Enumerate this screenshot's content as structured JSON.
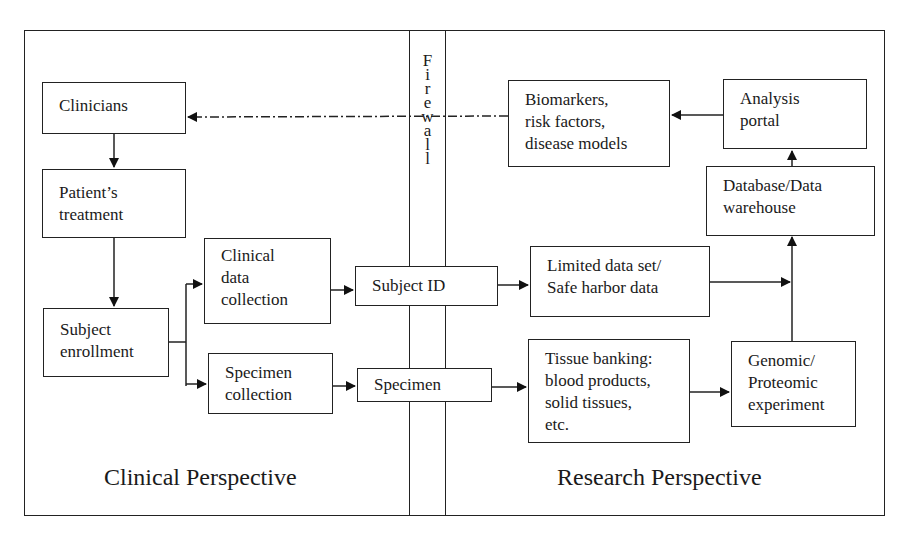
{
  "diagram": {
    "firewall": {
      "letters": [
        "F",
        "i",
        "r",
        "e",
        "w",
        "a",
        "l",
        "l"
      ]
    },
    "perspectives": {
      "clinical": "Clinical Perspective",
      "research": "Research Perspective"
    },
    "nodes": {
      "clinicians": [
        "Clinicians"
      ],
      "patients_treatment": [
        "Patient’s",
        "treatment"
      ],
      "subject_enrollment": [
        "Subject",
        "enrollment"
      ],
      "clinical_data_collection": [
        "Clinical",
        "data",
        "collection"
      ],
      "specimen_collection": [
        "Specimen",
        "collection"
      ],
      "subject_id": [
        "Subject ID"
      ],
      "specimen": [
        "Specimen"
      ],
      "biomarkers": [
        "Biomarkers,",
        "risk factors,",
        "disease models"
      ],
      "analysis_portal": [
        "Analysis",
        "portal"
      ],
      "database": [
        "Database/Data",
        "warehouse"
      ],
      "limited_data_set": [
        "Limited data set/",
        "Safe harbor data"
      ],
      "tissue_banking": [
        "Tissue banking:",
        "blood products,",
        "solid tissues,",
        "etc."
      ],
      "genomic": [
        "Genomic/",
        "Proteomic",
        "experiment"
      ]
    },
    "edges": [
      {
        "from": "clinicians",
        "to": "patients_treatment"
      },
      {
        "from": "patients_treatment",
        "to": "subject_enrollment"
      },
      {
        "from": "subject_enrollment",
        "to": "clinical_data_collection"
      },
      {
        "from": "subject_enrollment",
        "to": "specimen_collection"
      },
      {
        "from": "clinical_data_collection",
        "to": "subject_id"
      },
      {
        "from": "specimen_collection",
        "to": "specimen"
      },
      {
        "from": "subject_id",
        "to": "limited_data_set"
      },
      {
        "from": "specimen",
        "to": "tissue_banking"
      },
      {
        "from": "tissue_banking",
        "to": "genomic"
      },
      {
        "from": "limited_data_set",
        "to": "database"
      },
      {
        "from": "genomic",
        "to": "database"
      },
      {
        "from": "database",
        "to": "analysis_portal"
      },
      {
        "from": "analysis_portal",
        "to": "biomarkers"
      },
      {
        "from": "biomarkers",
        "to": "clinicians",
        "style": "dash-dot"
      }
    ]
  }
}
